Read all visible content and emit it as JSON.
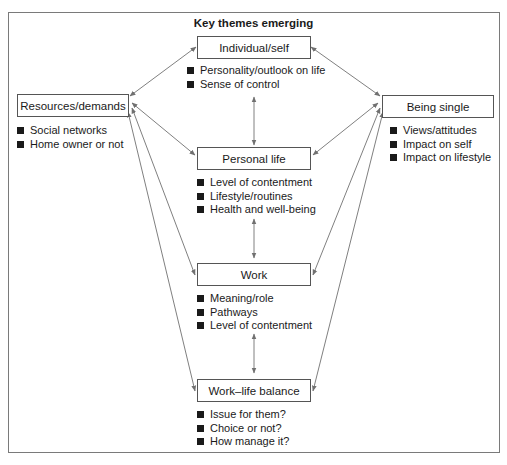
{
  "title": "Key themes emerging",
  "nodes": {
    "individual": {
      "label": "Individual/self",
      "items": [
        "Personality/outlook on life",
        "Sense of control"
      ]
    },
    "resources": {
      "label": "Resources/demands",
      "items": [
        "Social networks",
        "Home owner or not"
      ]
    },
    "single": {
      "label": "Being single",
      "items": [
        "Views/attitudes",
        "Impact on self",
        "Impact on lifestyle"
      ]
    },
    "personal": {
      "label": "Personal life",
      "items": [
        "Level of contentment",
        "Lifestyle/routines",
        "Health and well-being"
      ]
    },
    "work": {
      "label": "Work",
      "items": [
        "Meaning/role",
        "Pathways",
        "Level of contentment"
      ]
    },
    "balance": {
      "label": "Work–life balance",
      "items": [
        "Issue for them?",
        "Choice or not?",
        "How manage it?"
      ]
    }
  },
  "colors": {
    "connector": "#808080",
    "border": "#555555",
    "frame": "#7a7a7a"
  }
}
